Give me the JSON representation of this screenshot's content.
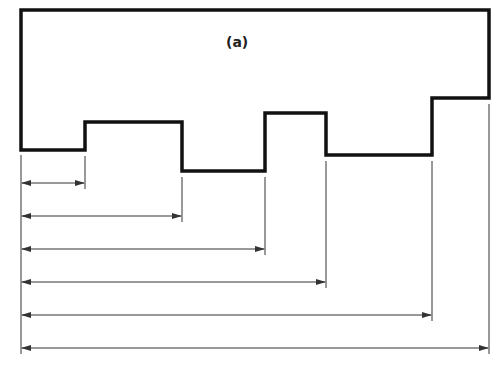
{
  "figure": {
    "label": "(a)",
    "colors": {
      "outline": "#111111",
      "dimension": "#333333",
      "background": "#ffffff"
    },
    "profile_points": [
      [
        21,
        10
      ],
      [
        489,
        10
      ],
      [
        489,
        98
      ],
      [
        432,
        98
      ],
      [
        432,
        155
      ],
      [
        326,
        155
      ],
      [
        326,
        113
      ],
      [
        265,
        113
      ],
      [
        265,
        171
      ],
      [
        182,
        171
      ],
      [
        182,
        122
      ],
      [
        85,
        122
      ],
      [
        85,
        150
      ],
      [
        21,
        150
      ]
    ],
    "dimension_lines": [
      {
        "y": 183,
        "x_end": 85
      },
      {
        "y": 216,
        "x_end": 182
      },
      {
        "y": 249,
        "x_end": 265
      },
      {
        "y": 282,
        "x_end": 326
      },
      {
        "y": 315,
        "x_end": 432
      },
      {
        "y": 348,
        "x_end": 489
      }
    ]
  }
}
